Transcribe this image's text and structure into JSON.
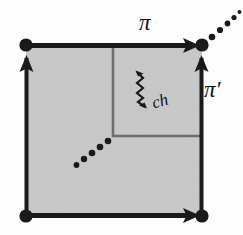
{
  "figure": {
    "background_color": "#fdfdfd",
    "fill_color": "#c8c8c8",
    "stroke_color": "#1a1a1a",
    "inner_stroke_color": "#6e6e6e",
    "labels": {
      "pi": "π",
      "pi_prime": "π′",
      "ch": "ch"
    },
    "nodes": [
      {
        "name": "top-left-vertex",
        "x": 26,
        "y": 45
      },
      {
        "name": "top-right-vertex",
        "x": 202,
        "y": 45
      },
      {
        "name": "bottom-left-vertex",
        "x": 26,
        "y": 216
      },
      {
        "name": "bottom-right-vertex",
        "x": 202,
        "y": 216
      }
    ],
    "edges": [
      {
        "name": "top-edge",
        "label": "π",
        "direction": "right"
      },
      {
        "name": "right-edge",
        "label": "π′",
        "direction": "up"
      },
      {
        "name": "left-edge",
        "label": "",
        "direction": "up"
      },
      {
        "name": "bottom-edge",
        "label": "",
        "direction": "right"
      }
    ],
    "inner_square": {
      "x": 113,
      "y": 45,
      "width": 90,
      "height": 91
    },
    "squiggly_arrow": {
      "name": "ch-squiggly-arrow",
      "label": "ch",
      "heads": "both"
    },
    "dotted_lines": [
      {
        "name": "outer-dotted-diagonal",
        "dots": 5
      },
      {
        "name": "inner-dotted-diagonal",
        "dots": 5
      }
    ]
  }
}
